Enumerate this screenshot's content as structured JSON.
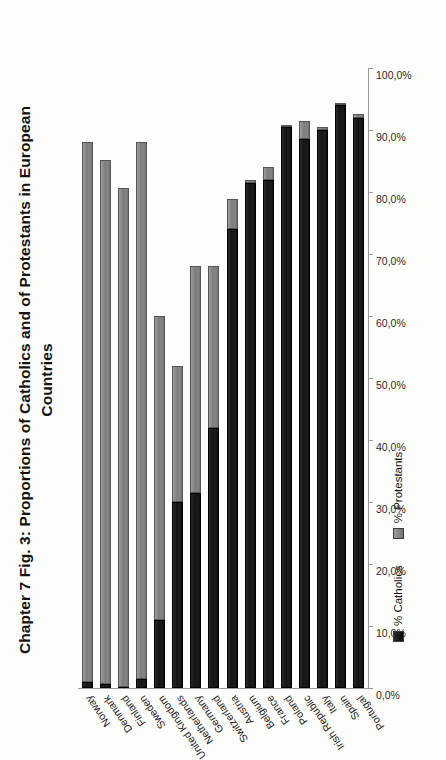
{
  "title": {
    "line1": "Chapter 7   Fig. 3:  Proportions of Catholics and of Protestants in European",
    "line2": "Countries"
  },
  "legend": {
    "position": "below-plot",
    "items": [
      {
        "label": "% Catholics",
        "color": "#141414",
        "icon": "square-swatch-catholics"
      },
      {
        "label": "% Protestants",
        "color": "#7c7c7c",
        "icon": "square-swatch-protestants"
      }
    ]
  },
  "axis": {
    "tick_labels": [
      "100,0%",
      "90,0%",
      "80,0%",
      "70,0%",
      "60,0%",
      "50,0%",
      "40,0%",
      "30,0%",
      "20,0%",
      "10,0%",
      "0,0%"
    ],
    "min": 0,
    "max": 100
  },
  "chart_data": {
    "type": "bar",
    "orientation": "horizontal-stacked",
    "title": "Chapter 7   Fig. 3:  Proportions of Catholics and of Protestants in European Countries",
    "xlabel": "",
    "ylabel": "",
    "xlim": [
      0,
      100
    ],
    "grid": false,
    "legend_position": "bottom",
    "stacked": true,
    "categories": [
      "Norway",
      "Denmark",
      "Finland",
      "Sweden",
      "United Kingdom",
      "Netherlands",
      "Germany",
      "Switzerland",
      "Austria",
      "Belgium",
      "France",
      "Poland",
      "Irish Republic",
      "Italy",
      "Spain",
      "Portugal"
    ],
    "series": [
      {
        "name": "% Catholics",
        "color": "#141414",
        "values": [
          1.0,
          0.6,
          0.2,
          1.5,
          11.0,
          30.0,
          31.5,
          42.0,
          74.0,
          81.5,
          82.0,
          90.5,
          88.5,
          90.0,
          94.0,
          92.0
        ]
      },
      {
        "name": "% Protestants",
        "color": "#7c7c7c",
        "values": [
          87.0,
          84.5,
          80.5,
          86.5,
          49.0,
          22.0,
          36.5,
          26.0,
          4.8,
          0.4,
          2.0,
          0.3,
          3.0,
          0.5,
          0.3,
          0.6
        ]
      }
    ]
  }
}
